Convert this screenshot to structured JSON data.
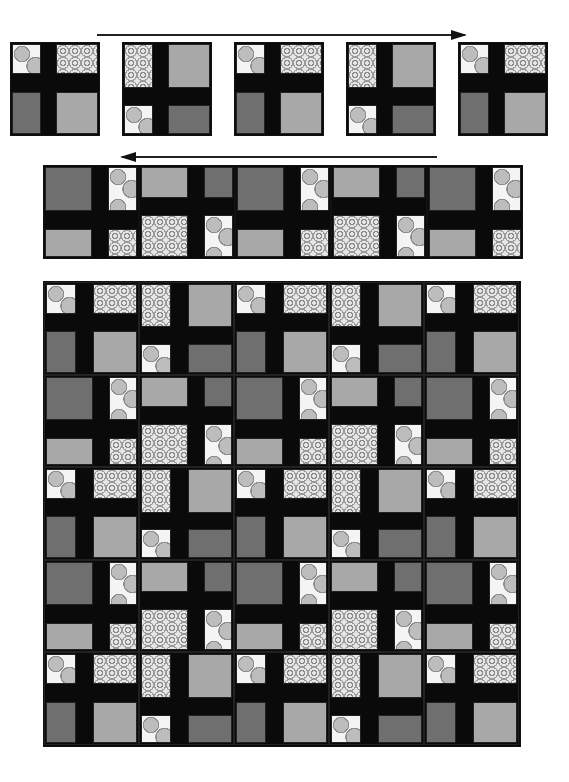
{
  "diagram": {
    "title": "",
    "block_types": {
      "A": {
        "tl": "dots",
        "tr": "floral",
        "bl": "dark",
        "br": "light",
        "vbar": [
          0.33,
          0.5
        ],
        "hbar": [
          0.33,
          0.52
        ]
      },
      "B": {
        "tl": "floral",
        "tr": "light",
        "bl": "dots",
        "br": "dark",
        "vbar": [
          0.33,
          0.5
        ],
        "hbar": [
          0.48,
          0.66
        ]
      },
      "A_rot": {
        "tl": "dark",
        "tr": "dots",
        "bl": "light",
        "br": "floral",
        "vbar": [
          0.5,
          0.67
        ],
        "hbar": [
          0.48,
          0.67
        ]
      },
      "B_rot": {
        "tl": "light",
        "tr": "dark",
        "bl": "floral",
        "br": "dots",
        "vbar": [
          0.5,
          0.67
        ],
        "hbar": [
          0.34,
          0.52
        ]
      }
    },
    "colors": {
      "sashing": "#0a0a0a",
      "dark": "#6f6f6f",
      "light": "#a8a8a8",
      "dots_bg": "#f4f4f4",
      "floral_bg": "#e6e6e6"
    },
    "step1": {
      "arrow_direction": "right",
      "blocks": [
        "A",
        "B",
        "A",
        "B",
        "A"
      ]
    },
    "step2": {
      "arrow_direction": "left",
      "blocks": [
        "A_rot",
        "B_rot",
        "A_rot",
        "B_rot",
        "A_rot"
      ]
    },
    "quilt": {
      "columns": 5,
      "rows": [
        [
          "A",
          "B",
          "A",
          "B",
          "A"
        ],
        [
          "A_rot",
          "B_rot",
          "A_rot",
          "B_rot",
          "A_rot"
        ],
        [
          "A",
          "B",
          "A",
          "B",
          "A"
        ],
        [
          "A_rot",
          "B_rot",
          "A_rot",
          "B_rot",
          "A_rot"
        ],
        [
          "A",
          "B",
          "A",
          "B",
          "A"
        ]
      ]
    }
  }
}
